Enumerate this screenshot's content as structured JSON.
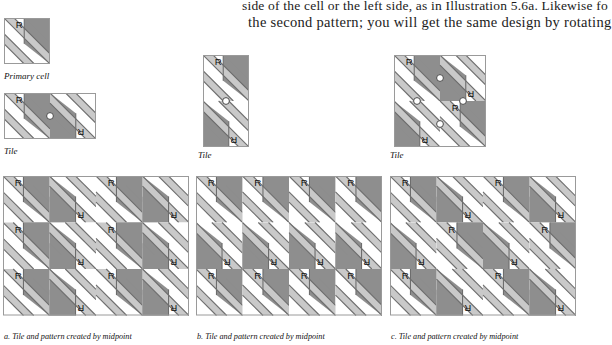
{
  "page": {
    "width": 592,
    "height": 345,
    "background": "#ffffff"
  },
  "top_text": {
    "line1": "side of the cell or the left side, as in Illustration 5.6a. Likewise fo",
    "line2": "the second pattern; you will get the same design by rotating"
  },
  "labels": {
    "primary_cell": "Primary cell",
    "tile_a": "Tile",
    "tile_b": "Tile",
    "tile_c": "Tile",
    "letter": "R"
  },
  "captions": {
    "a": "a. Tile and pattern created by midpoint",
    "b": "b. Tile and pattern created by midpoint",
    "c": "c. Tile and pattern created by midpoint"
  },
  "colors": {
    "dark": "#8e8e8e",
    "light": "#c9c9c9",
    "white": "#ffffff",
    "outline": "#6d6d6d",
    "border": "#9a9a9a",
    "dot_fill": "#ffffff",
    "dot_stroke": "#4a4a4a",
    "text": "#111111"
  },
  "figures": {
    "primary_cell": {
      "columns": 1,
      "rows": 1,
      "cell_px": 46
    },
    "tile_a": {
      "columns": 2,
      "rows": 1,
      "cell_px": 46,
      "rotation_centers": [
        [
          1,
          0.5
        ]
      ],
      "cell_orientations": [
        [
          0,
          180
        ]
      ]
    },
    "tile_b": {
      "columns": 1,
      "rows": 2,
      "cell_px": 46,
      "rotation_centers": [
        [
          0.5,
          1
        ]
      ],
      "cell_orientations": [
        [
          0
        ],
        [
          180
        ]
      ]
    },
    "tile_c": {
      "columns": 2,
      "rows": 2,
      "cell_px": 46,
      "rotation_centers": [
        [
          1,
          0.5
        ],
        [
          0.5,
          1
        ],
        [
          1.5,
          1
        ],
        [
          1,
          1.5
        ]
      ],
      "cell_orientations": [
        [
          0,
          180
        ],
        [
          180,
          0
        ]
      ]
    },
    "pattern_a": {
      "columns": 4,
      "rows": 3,
      "cell_px": 46.5,
      "orientation_rule": "column-alternating",
      "orientations": [
        [
          0,
          180,
          0,
          180
        ],
        [
          0,
          180,
          0,
          180
        ],
        [
          0,
          180,
          0,
          180
        ]
      ]
    },
    "pattern_b": {
      "columns": 4,
      "rows": 3,
      "cell_px": 46.5,
      "orientation_rule": "row-alternating",
      "orientations": [
        [
          0,
          0,
          0,
          0
        ],
        [
          180,
          180,
          180,
          180
        ],
        [
          0,
          0,
          0,
          0
        ]
      ]
    },
    "pattern_c": {
      "columns": 4,
      "rows": 3,
      "cell_px": 46.5,
      "orientation_rule": "checkerboard",
      "orientations": [
        [
          0,
          180,
          0,
          180
        ],
        [
          180,
          0,
          180,
          0
        ],
        [
          0,
          180,
          0,
          180
        ]
      ]
    }
  }
}
